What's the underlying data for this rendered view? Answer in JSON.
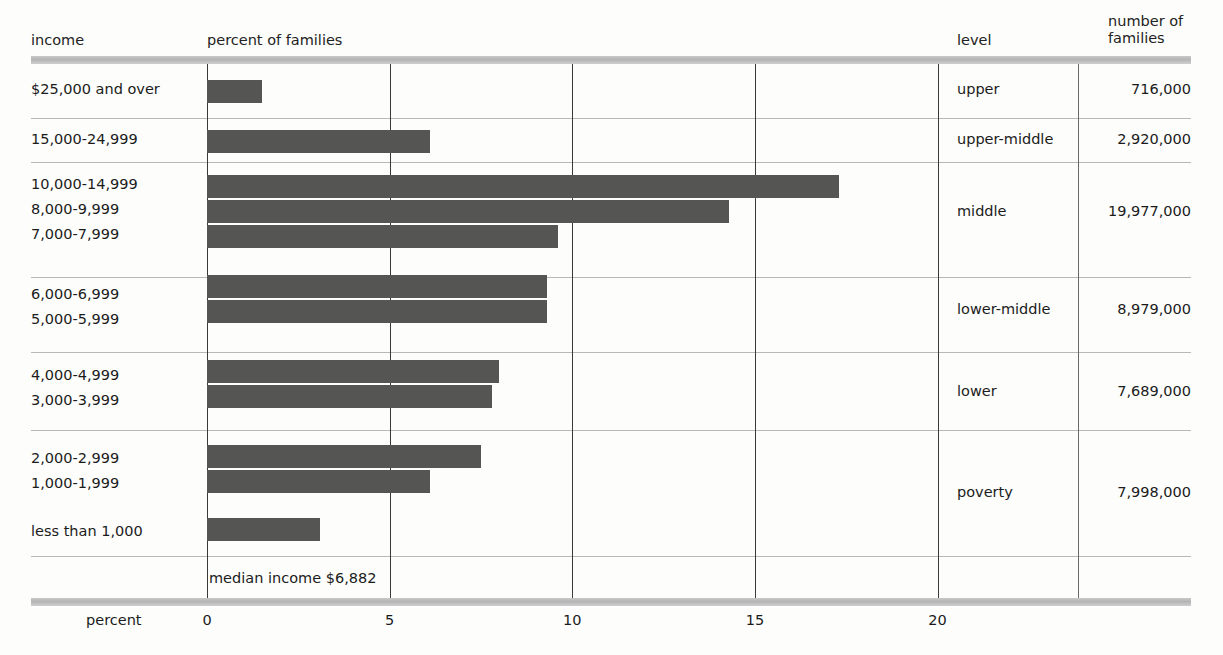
{
  "headers": {
    "income": "income",
    "percent_of_families": "percent of families",
    "level": "level",
    "number_of_families_line1": "number of",
    "number_of_families_line2": "families"
  },
  "axis": {
    "title": "percent",
    "ticks": [
      "0",
      "5",
      "10",
      "15",
      "20"
    ]
  },
  "annotation": {
    "median": "median income $6,882"
  },
  "levels": [
    {
      "name": "upper",
      "families": "716,000"
    },
    {
      "name": "upper-middle",
      "families": "2,920,000"
    },
    {
      "name": "middle",
      "families": "19,977,000"
    },
    {
      "name": "lower-middle",
      "families": "8,979,000"
    },
    {
      "name": "lower",
      "families": "7,689,000"
    },
    {
      "name": "poverty",
      "families": "7,998,000"
    }
  ],
  "rows": [
    {
      "income": "$25,000 and over",
      "percent": 1.5
    },
    {
      "income": "15,000-24,999",
      "percent": 6.1
    },
    {
      "income": "10,000-14,999",
      "percent": 17.3
    },
    {
      "income": "8,000-9,999",
      "percent": 14.3
    },
    {
      "income": "7,000-7,999",
      "percent": 9.6
    },
    {
      "income": "6,000-6,999",
      "percent": 9.3
    },
    {
      "income": "5,000-5,999",
      "percent": 9.3
    },
    {
      "income": "4,000-4,999",
      "percent": 8.0
    },
    {
      "income": "3,000-3,999",
      "percent": 7.8
    },
    {
      "income": "2,000-2,999",
      "percent": 7.5
    },
    {
      "income": "1,000-1,999",
      "percent": 6.1
    },
    {
      "income": "less than 1,000",
      "percent": 3.1
    }
  ],
  "colors": {
    "bar": "#555553",
    "rule": "#bdbdbd",
    "grid": "#3a3a3a",
    "text": "#1b1b1b",
    "background": "#fdfdfb"
  },
  "chart_data": {
    "type": "bar",
    "orientation": "horizontal",
    "title": "",
    "xlabel": "percent",
    "ylabel": "income",
    "xlim": [
      0,
      23.5
    ],
    "grid": true,
    "legend": "none",
    "xticks": [
      0,
      5,
      10,
      15,
      20
    ],
    "categories": [
      "$25,000 and over",
      "15,000-24,999",
      "10,000-14,999",
      "8,000-9,999",
      "7,000-7,999",
      "6,000-6,999",
      "5,000-5,999",
      "4,000-4,999",
      "3,000-3,999",
      "2,000-2,999",
      "1,000-1,999",
      "less than 1,000"
    ],
    "values": [
      1.5,
      6.1,
      17.3,
      14.3,
      9.6,
      9.3,
      9.3,
      8.0,
      7.8,
      7.5,
      6.1,
      3.1
    ],
    "series": [
      {
        "name": "percent of families",
        "values": [
          1.5,
          6.1,
          17.3,
          14.3,
          9.6,
          9.3,
          9.3,
          8.0,
          7.8,
          7.5,
          6.1,
          3.1
        ]
      }
    ],
    "annotations": [
      "median income $6,882"
    ],
    "groups": [
      {
        "level": "upper",
        "categories": [
          "$25,000 and over"
        ],
        "number_of_families": 716000
      },
      {
        "level": "upper-middle",
        "categories": [
          "15,000-24,999"
        ],
        "number_of_families": 2920000
      },
      {
        "level": "middle",
        "categories": [
          "10,000-14,999",
          "8,000-9,999",
          "7,000-7,999"
        ],
        "number_of_families": 19977000
      },
      {
        "level": "lower-middle",
        "categories": [
          "6,000-6,999",
          "5,000-5,999"
        ],
        "number_of_families": 8979000
      },
      {
        "level": "lower",
        "categories": [
          "4,000-4,999",
          "3,000-3,999"
        ],
        "number_of_families": 7689000
      },
      {
        "level": "poverty",
        "categories": [
          "2,000-2,999",
          "1,000-1,999",
          "less than 1,000"
        ],
        "number_of_families": 7998000
      }
    ]
  }
}
